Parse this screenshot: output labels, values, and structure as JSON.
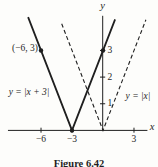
{
  "figure": {
    "caption": "Figure 6.42",
    "background": "#fdfdfb",
    "ink": "#1f1f1f"
  },
  "chart_data": {
    "type": "line",
    "title": "",
    "xlabel": "x",
    "ylabel": "y",
    "xlim": [
      -9.2,
      4.3
    ],
    "ylim": [
      0,
      4.3
    ],
    "grid": false,
    "legend": "inline-labels",
    "x_ticks": [
      {
        "value": -6,
        "label": "−6"
      },
      {
        "value": -3,
        "label": "−3"
      },
      {
        "value": 3,
        "label": "3"
      }
    ],
    "y_ticks": [
      {
        "value": 1,
        "label": "1"
      },
      {
        "value": 2,
        "label": "2"
      },
      {
        "value": 3,
        "label": "3"
      }
    ],
    "series": [
      {
        "name": "y = |x + 3|",
        "line_style": "solid",
        "vertex": [
          -3,
          0
        ],
        "points": [
          [
            -7.25,
            4.25
          ],
          [
            -3,
            0
          ],
          [
            1.17,
            4.17
          ]
        ]
      },
      {
        "name": "y = |x|",
        "line_style": "dashed",
        "vertex": [
          0,
          0
        ],
        "points": [
          [
            -4,
            4
          ],
          [
            0,
            0
          ],
          [
            4.15,
            4.15
          ]
        ]
      }
    ],
    "marked_points": [
      {
        "x": -6,
        "y": 3,
        "label": "(−6, 3)"
      },
      {
        "x": 0,
        "y": 3,
        "label": ""
      },
      {
        "x": -3,
        "y": 0,
        "label": ""
      }
    ]
  }
}
